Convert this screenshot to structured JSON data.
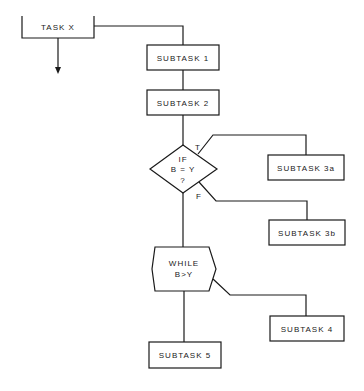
{
  "diagram": {
    "type": "structured-flowchart",
    "nodes": {
      "task_x": {
        "label": "TASK X",
        "shape": "open-top-box"
      },
      "subtask_1": {
        "label": "SUBTASK 1",
        "shape": "rectangle"
      },
      "subtask_2": {
        "label": "SUBTASK 2",
        "shape": "rectangle"
      },
      "decision": {
        "line1": "IF",
        "line2": "B = Y",
        "line3": "?",
        "shape": "diamond"
      },
      "subtask_3a": {
        "label": "SUBTASK 3a",
        "shape": "rectangle"
      },
      "subtask_3b": {
        "label": "SUBTASK 3b",
        "shape": "rectangle"
      },
      "loop": {
        "line1": "WHILE",
        "line2": "B>Y",
        "shape": "hexagon"
      },
      "subtask_4": {
        "label": "SUBTASK 4",
        "shape": "rectangle"
      },
      "subtask_5": {
        "label": "SUBTASK 5",
        "shape": "rectangle"
      }
    },
    "branch_labels": {
      "true": "T",
      "false": "F"
    },
    "edges": [
      {
        "from": "task_x",
        "to": "subtask_1"
      },
      {
        "from": "subtask_1",
        "to": "subtask_2"
      },
      {
        "from": "subtask_2",
        "to": "decision"
      },
      {
        "from": "decision",
        "to": "subtask_3a",
        "label": "T"
      },
      {
        "from": "decision",
        "to": "subtask_3b",
        "label": "F"
      },
      {
        "from": "decision",
        "to": "loop"
      },
      {
        "from": "loop",
        "to": "subtask_4"
      },
      {
        "from": "loop",
        "to": "subtask_5"
      },
      {
        "from": "task_x",
        "to": "next",
        "arrow": true
      }
    ],
    "colors": {
      "stroke": "#1a1a1a",
      "background": "#ffffff"
    }
  }
}
